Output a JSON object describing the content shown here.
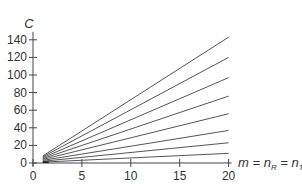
{
  "chart_data": {
    "type": "line",
    "title": "",
    "ylabel": "C",
    "xlabel": "m = n_R = n_T",
    "xlabel_parts": {
      "main": "m = n",
      "sub1": "R",
      "mid": " = n",
      "sub2": "T"
    },
    "xlim": [
      0,
      20
    ],
    "ylim": [
      0,
      140
    ],
    "xticks": [
      0,
      5,
      10,
      15,
      20
    ],
    "yticks": [
      0,
      20,
      40,
      60,
      80,
      100,
      120,
      140
    ],
    "grid": false,
    "legend": null,
    "x": [
      1,
      20
    ],
    "series": [
      {
        "name": "line 1",
        "values": [
          8,
          143
        ]
      },
      {
        "name": "line 2",
        "values": [
          7,
          120
        ]
      },
      {
        "name": "line 3",
        "values": [
          6,
          97
        ]
      },
      {
        "name": "line 4",
        "values": [
          5,
          76
        ]
      },
      {
        "name": "line 5",
        "values": [
          4,
          56
        ]
      },
      {
        "name": "line 6",
        "values": [
          3,
          37
        ]
      },
      {
        "name": "line 7",
        "values": [
          2,
          23
        ]
      },
      {
        "name": "line 8",
        "values": [
          1,
          11
        ]
      }
    ]
  },
  "layout": {
    "x0_px": 33,
    "x_px_per_unit": 9.78,
    "y0_px": 163,
    "y_px_per_unit": 0.88,
    "line_color": "#555555",
    "axis_color": "#444444"
  }
}
